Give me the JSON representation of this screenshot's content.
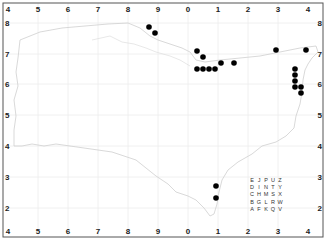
{
  "map": {
    "frame": {
      "x": 3,
      "y": 3,
      "width": 320,
      "height": 234,
      "stroke": "#555555"
    },
    "grid_color": "#ececec",
    "coast_color": "#cfcfcf",
    "dot_color": "#000000",
    "x_ticks": [
      {
        "label": "4",
        "x": 8
      },
      {
        "label": "5",
        "x": 38
      },
      {
        "label": "6",
        "x": 68
      },
      {
        "label": "7",
        "x": 98
      },
      {
        "label": "8",
        "x": 128
      },
      {
        "label": "9",
        "x": 158
      },
      {
        "label": "0",
        "x": 188
      },
      {
        "label": "1",
        "x": 218
      },
      {
        "label": "2",
        "x": 248
      },
      {
        "label": "3",
        "x": 278
      },
      {
        "label": "4",
        "x": 308
      }
    ],
    "y_ticks": [
      {
        "label": "8",
        "y": 23
      },
      {
        "label": "7",
        "y": 54
      },
      {
        "label": "6",
        "y": 84
      },
      {
        "label": "5",
        "y": 115
      },
      {
        "label": "4",
        "y": 146
      },
      {
        "label": "3",
        "y": 177
      },
      {
        "label": "2",
        "y": 208
      }
    ],
    "corner_labels": {
      "top_left": "4",
      "top_right": "4",
      "bottom_left": "4",
      "bottom_right": "4"
    },
    "records": [
      {
        "x": 149,
        "y": 27
      },
      {
        "x": 155,
        "y": 33
      },
      {
        "x": 197,
        "y": 51
      },
      {
        "x": 203,
        "y": 57
      },
      {
        "x": 197,
        "y": 69
      },
      {
        "x": 203,
        "y": 69
      },
      {
        "x": 209,
        "y": 69
      },
      {
        "x": 215,
        "y": 69
      },
      {
        "x": 221,
        "y": 63
      },
      {
        "x": 234,
        "y": 63
      },
      {
        "x": 276,
        "y": 50
      },
      {
        "x": 306,
        "y": 50
      },
      {
        "x": 295,
        "y": 69
      },
      {
        "x": 295,
        "y": 75
      },
      {
        "x": 295,
        "y": 81
      },
      {
        "x": 295,
        "y": 87
      },
      {
        "x": 301,
        "y": 87
      },
      {
        "x": 301,
        "y": 93
      },
      {
        "x": 216,
        "y": 186
      },
      {
        "x": 216,
        "y": 198
      }
    ],
    "legend": {
      "title": "tetrad key",
      "rows": [
        [
          "E",
          "J",
          "P",
          "U",
          "Z"
        ],
        [
          "D",
          "I",
          "N",
          "T",
          "Y"
        ],
        [
          "C",
          "H",
          "M",
          "S",
          "X"
        ],
        [
          "B",
          "G",
          "L",
          "R",
          "W"
        ],
        [
          "A",
          "F",
          "K",
          "Q",
          "V"
        ]
      ]
    }
  }
}
